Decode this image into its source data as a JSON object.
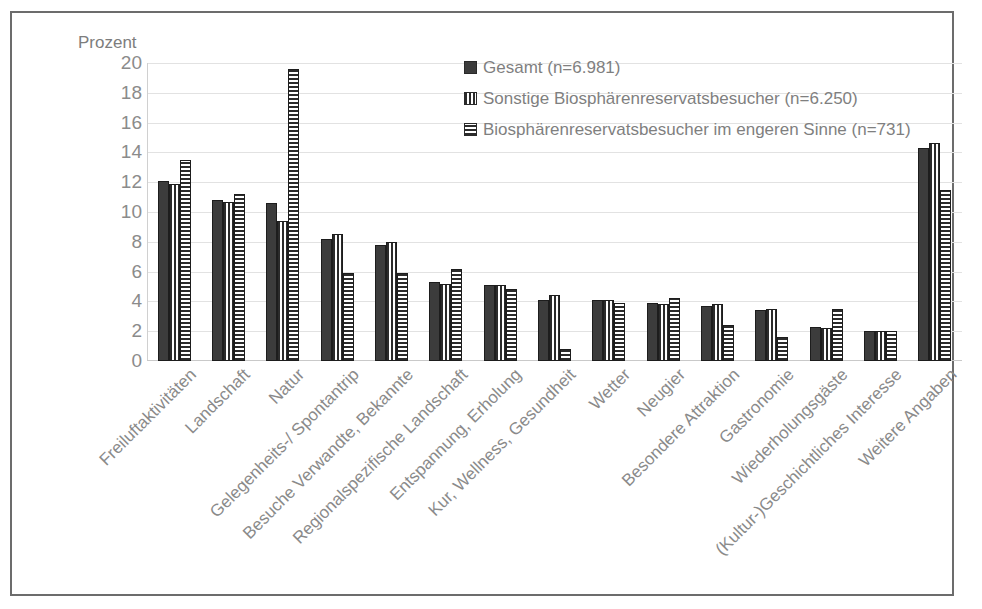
{
  "chart_data": {
    "type": "bar",
    "title": "",
    "ylabel": "Prozent",
    "xlabel": "",
    "ylim": [
      0,
      20
    ],
    "yticks": [
      20,
      18,
      16,
      14,
      12,
      10,
      8,
      6,
      4,
      2,
      0
    ],
    "grid": true,
    "legend_position": "top-right",
    "categories": [
      "Freiluftaktivitäten",
      "Landschaft",
      "Natur",
      "Gelegenheits-/ Spontantrip",
      "Besuche Verwandte, Bekannte",
      "Regionalspezifische Landschaft",
      "Entspannung, Erholung",
      "Kur, Wellness, Gesundheit",
      "Wetter",
      "Neugier",
      "Besondere Attraktion",
      "Gastronomie",
      "Wiederholungsgäste",
      "(Kultur-)Geschichtliches Interesse",
      "Weitere Angaben"
    ],
    "series": [
      {
        "name": "Gesamt (n=6.981)",
        "pattern": "solid",
        "color": "#3c3c3c",
        "values": [
          12.1,
          10.8,
          10.6,
          8.2,
          7.8,
          5.3,
          5.1,
          4.1,
          4.1,
          3.9,
          3.7,
          3.4,
          2.3,
          2.0,
          14.3
        ]
      },
      {
        "name": "Sonstige Biosphärenreservatsbesucher (n=6.250)",
        "pattern": "vertical-stripes",
        "color": "#2b2b2b",
        "values": [
          11.9,
          10.7,
          9.4,
          8.5,
          8.0,
          5.2,
          5.1,
          4.4,
          4.1,
          3.8,
          3.8,
          3.5,
          2.2,
          2.0,
          14.6
        ]
      },
      {
        "name": "Biosphärenreservatsbesucher im engeren Sinne (n=731)",
        "pattern": "horizontal-stripes",
        "color": "#2b2b2b",
        "values": [
          13.5,
          11.2,
          19.6,
          5.9,
          5.9,
          6.2,
          4.8,
          0.8,
          3.9,
          4.2,
          2.4,
          1.6,
          3.5,
          2.0,
          11.5
        ]
      }
    ]
  },
  "legend": {
    "items": [
      "Gesamt (n=6.981)",
      "Sonstige Biosphärenreservatsbesucher (n=6.250)",
      "Biosphärenreservatsbesucher im engeren Sinne (n=731)"
    ]
  }
}
